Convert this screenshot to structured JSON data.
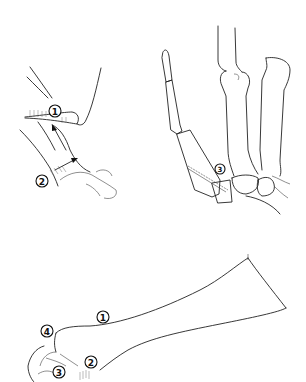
{
  "figure": {
    "panels": [
      {
        "id": "panel-a",
        "description": "Thumb base soft tissue with arrows",
        "labels": [
          {
            "text": "1",
            "x": 55,
            "y": 111
          },
          {
            "text": "2",
            "x": 42,
            "y": 181
          }
        ]
      },
      {
        "id": "panel-b",
        "description": "Skeletal view of thumb and metacarpals with guide wire",
        "labels": [
          {
            "text": "3",
            "x": 220,
            "y": 169
          }
        ]
      },
      {
        "id": "panel-c",
        "description": "Forearm-based thumb splint outline",
        "labels": [
          {
            "text": "1",
            "x": 103,
            "y": 317
          },
          {
            "text": "4",
            "x": 47,
            "y": 331
          },
          {
            "text": "2",
            "x": 91,
            "y": 362
          },
          {
            "text": "3",
            "x": 59,
            "y": 372
          }
        ]
      }
    ]
  }
}
